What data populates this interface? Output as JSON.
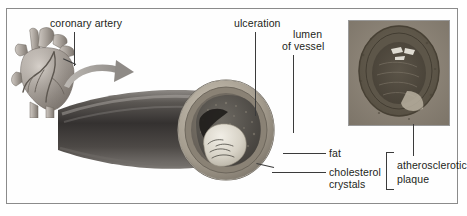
{
  "figure": {
    "kind": "medical-illustration",
    "border_color": "#8b8b8b",
    "background": "#ffffff",
    "text_color": "#231f20"
  },
  "labels": {
    "coronary_artery": "coronary artery",
    "ulceration": "ulceration",
    "lumen_line1": "lumen",
    "lumen_line2": "of vessel",
    "fat": "fat",
    "cholesterol_line1": "cholesterol",
    "cholesterol_line2": "crystals",
    "plaque_line1": "atherosclerotic",
    "plaque_line2": "plaque"
  },
  "panels": {
    "heart_name": "heart with coronary arteries",
    "vessel_name": "cut-away coronary artery with plaque",
    "micrograph_name": "histology cross-section of occluded artery",
    "arrow_name": "magnification arrow"
  },
  "grouping": {
    "bracket_members": [
      "fat",
      "cholesterol crystals"
    ],
    "bracket_label": "atherosclerotic plaque"
  }
}
